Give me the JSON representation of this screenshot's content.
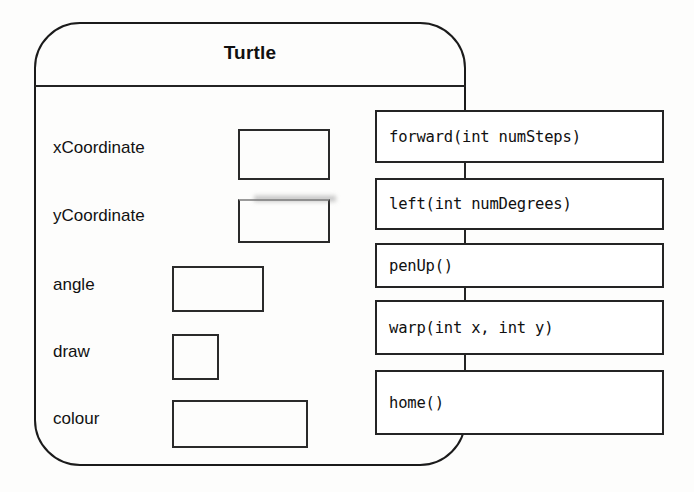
{
  "diagram": {
    "type": "uml-class-diagram",
    "class_name": "Turtle",
    "stroke_color": "#222222",
    "background_color": "#ffffff"
  },
  "attributes": [
    {
      "name": "xCoordinate",
      "value": ""
    },
    {
      "name": "yCoordinate",
      "value": ""
    },
    {
      "name": "angle",
      "value": ""
    },
    {
      "name": "draw",
      "value": ""
    },
    {
      "name": "colour",
      "value": ""
    }
  ],
  "methods": [
    {
      "signature": "forward(int numSteps)"
    },
    {
      "signature": "left(int numDegrees)"
    },
    {
      "signature": "penUp()"
    },
    {
      "signature": "warp(int x, int y)"
    },
    {
      "signature": "home()"
    }
  ]
}
